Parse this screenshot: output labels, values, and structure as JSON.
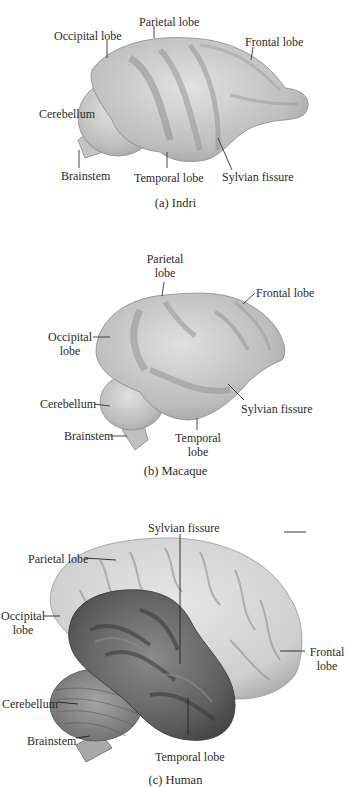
{
  "figures": [
    {
      "id": "a",
      "caption": "(a) Indri",
      "labels": {
        "occipital": "Occipital lobe",
        "parietal": "Parietal lobe",
        "frontal": "Frontal lobe",
        "cerebellum": "Cerebellum",
        "brainstem": "Brainstem",
        "temporal": "Temporal lobe",
        "sylvian": "Sylvian fissure"
      }
    },
    {
      "id": "b",
      "caption": "(b) Macaque",
      "labels": {
        "parietal_1": "Parietal",
        "parietal_2": "lobe",
        "frontal": "Frontal lobe",
        "occipital_1": "Occipital",
        "occipital_2": "lobe",
        "cerebellum": "Cerebellum",
        "brainstem": "Brainstem",
        "temporal_1": "Temporal",
        "temporal_2": "lobe",
        "sylvian": "Sylvian fissure"
      }
    },
    {
      "id": "c",
      "caption": "(c) Human",
      "labels": {
        "sylvian": "Sylvian fissure",
        "parietal": "Parietal lobe",
        "occipital_1": "Occipital",
        "occipital_2": "lobe",
        "frontal_1": "Frontal",
        "frontal_2": "lobe",
        "cerebellum": "Cerebellum",
        "brainstem": "Brainstem",
        "temporal": "Temporal lobe"
      }
    }
  ],
  "colors": {
    "brain_light": "#d8d8d8",
    "brain_mid": "#b9b9b9",
    "brain_dark": "#8e8e8e",
    "temporal_dark": "#5f5f5f",
    "leader_line": "#333333"
  }
}
